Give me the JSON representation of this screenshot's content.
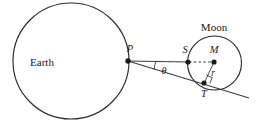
{
  "figure": {
    "background_color": "#ffffff",
    "stroke_color": "#2b2b2b",
    "label_color": "#1a1a1a",
    "width": 260,
    "height": 126
  },
  "labels": {
    "earth": "Earth",
    "moon": "Moon",
    "point_p": "P",
    "point_s": "S",
    "point_m": "M",
    "point_t": "T",
    "radius": "r",
    "angle": "θ"
  },
  "geometry": {
    "earth_circle": {
      "cx": 71,
      "cy": 61,
      "r": 58
    },
    "moon_circle": {
      "cx": 214.5,
      "cy": 63,
      "r": 27
    },
    "point_p": {
      "x": 128,
      "y": 61
    },
    "point_s": {
      "x": 188,
      "y": 62
    },
    "point_m": {
      "x": 214,
      "y": 62
    },
    "point_t": {
      "x": 204,
      "y": 83
    },
    "tangent_end": {
      "x": 249,
      "y": 98
    },
    "sight_line": "P to S solid, S to M dashed",
    "tangent_line": "P through T extended",
    "radius_segment": "M to T",
    "right_angle_at": "T"
  }
}
